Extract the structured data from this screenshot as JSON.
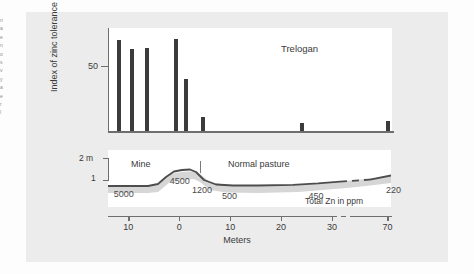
{
  "figure": {
    "site_label": "Trelogan",
    "margin_fragments": [
      "n",
      "a",
      "e",
      "n",
      "o",
      "s",
      "v",
      "y",
      "a",
      "e",
      "r",
      "l"
    ]
  },
  "top_panel": {
    "y_axis_label": "Index of zinc tolerance",
    "y_tick_label": "50"
  },
  "bottom_panel": {
    "axis_top_label": "2 m",
    "axis_bottom_label": "1",
    "zone_mine": "Mine",
    "zone_pasture": "Normal pasture",
    "zn_caption": "Total Zn in ppm"
  },
  "x_axis": {
    "title": "Meters",
    "tick_labels": [
      "10",
      "0",
      "10",
      "20",
      "30",
      "70"
    ]
  },
  "chart_data": {
    "type": "bar",
    "title": "Trelogan",
    "xlabel": "Meters",
    "ylabel": "Index of zinc tolerance",
    "ylim": [
      0,
      100
    ],
    "xlim": [
      -14,
      74
    ],
    "grid": false,
    "legend": "none",
    "x": [
      -12,
      -9.5,
      -6.5,
      -0.8,
      1.2,
      4.5,
      24,
      70
    ],
    "values": [
      88,
      80,
      81,
      89,
      51,
      14,
      9,
      11
    ],
    "tick_positions_meters": [
      -10,
      0,
      10,
      20,
      30,
      70
    ],
    "axis_break_between": [
      30,
      70
    ],
    "profile": {
      "type": "area",
      "description": "Land surface elevation cross-section with soil zinc concentrations",
      "y_tick_labels": [
        "2 m",
        "1"
      ],
      "zones": [
        {
          "label": "Mine",
          "x_range": [
            -14,
            0
          ]
        },
        {
          "label": "Normal pasture",
          "x_range": [
            0,
            74
          ]
        }
      ],
      "boundary_x": 0,
      "zn_labels": [
        {
          "value": "5000",
          "x": -12.5
        },
        {
          "value": "4500",
          "x": -1.5
        },
        {
          "value": "1200",
          "x": 2.5
        },
        {
          "value": "500",
          "x": 8
        },
        {
          "value": "450",
          "x": 25
        },
        {
          "value": "220",
          "x": 66
        }
      ],
      "zn_caption": "Total Zn in ppm"
    }
  }
}
